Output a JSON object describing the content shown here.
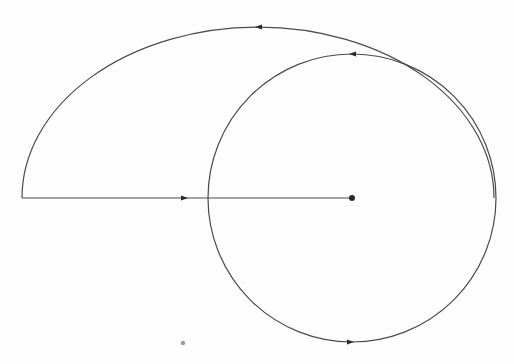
{
  "diagram": {
    "type": "contour-path",
    "canvas": {
      "width": 513,
      "height": 364,
      "background": "#fdfdfd"
    },
    "stroke_color": "#4a4a4a",
    "outer_arc": {
      "center": [
        258,
        198
      ],
      "rx": 236,
      "ry": 171,
      "start": [
        22,
        198
      ],
      "end": [
        494,
        198
      ],
      "arrow": {
        "at": [
          259,
          27
        ],
        "direction": "left"
      }
    },
    "circle": {
      "center": [
        352,
        198
      ],
      "r": 144,
      "arrows": [
        {
          "at": [
            353,
            54
          ],
          "direction": "left"
        },
        {
          "at": [
            350,
            342
          ],
          "direction": "right"
        }
      ]
    },
    "segment": {
      "from": [
        22,
        198
      ],
      "to": [
        352,
        198
      ],
      "arrow": {
        "at": [
          184,
          198
        ],
        "direction": "right"
      }
    },
    "center_point": {
      "at": [
        352,
        198
      ]
    },
    "stray_dot": {
      "at": [
        183,
        343
      ],
      "color": "#9a9a9a"
    }
  }
}
